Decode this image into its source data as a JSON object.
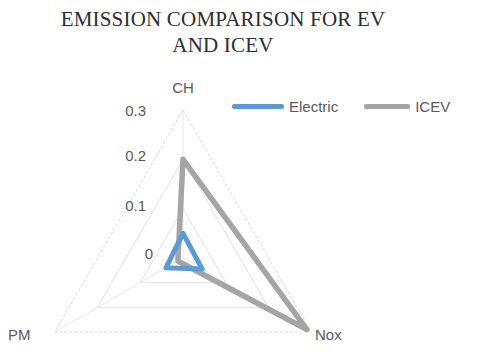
{
  "chart_data": {
    "type": "radar",
    "title": "EMISSION COMPARISON FOR EV\nAND ICEV",
    "categories": [
      "CH",
      "Nox",
      "PM"
    ],
    "series": [
      {
        "name": "Electric",
        "color": "#5B9BD5",
        "values": [
          0.05,
          0.045,
          0.04
        ]
      },
      {
        "name": "ICEV",
        "color": "#A5A5A5",
        "values": [
          0.2,
          0.29,
          0.012
        ]
      }
    ],
    "radial_ticks": [
      "0.3",
      "0.2",
      "0.1",
      "0"
    ],
    "radial_values": [
      0.3,
      0.2,
      0.1,
      0
    ],
    "rlim": [
      0,
      0.3
    ],
    "grid": true,
    "legend_position": "top-right",
    "xlabel": "",
    "ylabel": ""
  },
  "legend": {
    "entries": [
      {
        "label": "Electric"
      },
      {
        "label": "ICEV"
      }
    ]
  },
  "vertex_labels": {
    "top": "CH",
    "bottom_right": "Nox",
    "bottom_left": "PM"
  },
  "radial_axis": {
    "tick_0": "0",
    "tick_1": "0.1",
    "tick_2": "0.2",
    "tick_3": "0.3"
  },
  "colors": {
    "electric": "#5B9BD5",
    "icev": "#A5A5A5",
    "grid": "#dedede",
    "text": "#5a5a5a",
    "title": "#2e2e2e"
  }
}
